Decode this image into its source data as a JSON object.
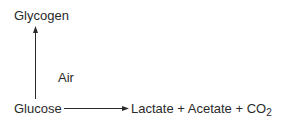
{
  "nodes": {
    "glycogen": "Glycogen",
    "glucose": "Glucose",
    "products": "Lactate + Acetate + CO",
    "products_subscript": "2"
  },
  "edges": [
    {
      "from": "glucose",
      "to": "glycogen",
      "label": "Air",
      "direction": "up"
    },
    {
      "from": "glucose",
      "to": "products",
      "label": "",
      "direction": "right"
    }
  ],
  "annotations": {
    "air_label": "Air"
  },
  "colors": {
    "text": "#2a2a2a",
    "arrow": "#2a2a2a",
    "background": "#ffffff"
  }
}
